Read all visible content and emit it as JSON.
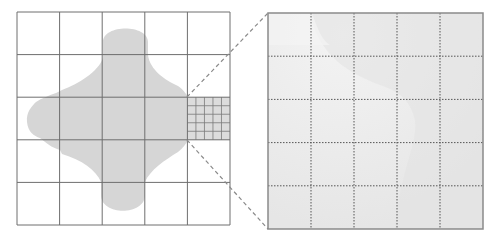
{
  "diagram": {
    "coarse_grid": {
      "rows": 5,
      "cols": 5,
      "x": 17,
      "y": 12,
      "size": 213,
      "line_color": "#6e6e6e"
    },
    "blob": {
      "fill": "#d6d6d6",
      "shape": "four-lobed cross"
    },
    "refined_cell": {
      "row": 2,
      "col": 4,
      "subdivisions": 5,
      "fill": "#dcdcdc",
      "line_color": "#7a7a7a"
    },
    "magnified_view": {
      "x": 268,
      "y": 13,
      "size": 215,
      "rows": 5,
      "cols": 5,
      "fill": "#e8e8e8",
      "border_color": "#8a8a8a",
      "inner_line_style": "dotted",
      "inner_line_color": "#555555"
    },
    "connector": {
      "style": "dashed",
      "color": "#8a8a8a"
    }
  }
}
